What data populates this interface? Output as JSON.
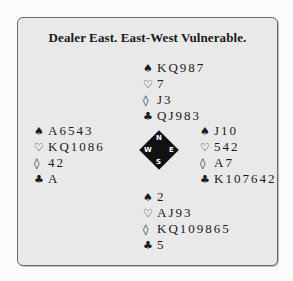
{
  "title": "Dealer East. East-West Vulnerable.",
  "suits": {
    "spades": "♠",
    "hearts": "♡",
    "diamonds": "◊",
    "clubs": "♣"
  },
  "hands": {
    "north": {
      "spades": "KQ987",
      "hearts": "7",
      "diamonds": "J3",
      "clubs": "QJ983"
    },
    "west": {
      "spades": "A6543",
      "hearts": "KQ1086",
      "diamonds": "42",
      "clubs": "A"
    },
    "east": {
      "spades": "J10",
      "hearts": "542",
      "diamonds": "A7",
      "clubs": "K107642"
    },
    "south": {
      "spades": "2",
      "hearts": "AJ93",
      "diamonds": "KQ109865",
      "clubs": "5"
    }
  },
  "compass": {
    "n": "N",
    "e": "E",
    "s": "S",
    "w": "W"
  }
}
